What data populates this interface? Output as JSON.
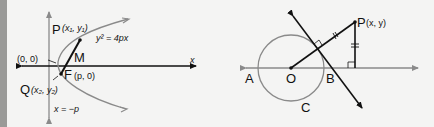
{
  "figures": [
    {
      "id": "parabola",
      "labels": {
        "P_letter": "P",
        "P_coords": "(x₁, y₁)",
        "Q_letter": "Q",
        "Q_coords": "(x₂, y₂)",
        "origin": "(0, 0)",
        "M": "M",
        "F_letter": "F",
        "F_coords": "(p, 0)",
        "equation": "y² = 4px",
        "x_axis": "x",
        "directrix": "x = −p"
      }
    },
    {
      "id": "circle",
      "labels": {
        "P_letter": "P",
        "P_coords": "(x, y)",
        "A": "A",
        "O": "O",
        "B": "B",
        "C": "C"
      }
    }
  ],
  "colors": {
    "background": "#f4f4f3",
    "ink": "#111111",
    "gray_curve": "#8a8a8a",
    "edge_bar": "#9a9a98"
  }
}
